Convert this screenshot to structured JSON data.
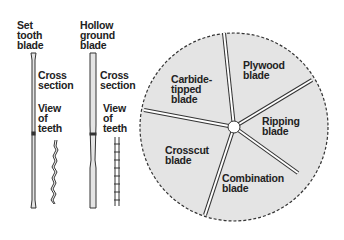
{
  "set_tooth": {
    "title": "Set\ntooth\nblade",
    "cross": "Cross\nsection",
    "view": "View\nof\nteeth"
  },
  "hollow_ground": {
    "title": "Hollow\nground\nblade",
    "cross": "Cross\nsection",
    "view": "View\nof\nteeth"
  },
  "circular_blade": {
    "segments": [
      {
        "label": "Carbide-\ntipped\nblade"
      },
      {
        "label": "Plywood\nblade"
      },
      {
        "label": "Ripping\nblade"
      },
      {
        "label": "Combination\nblade"
      },
      {
        "label": "Crosscut\nblade"
      }
    ],
    "colors": {
      "fill": "#e4e4e4",
      "stroke": "#333333"
    }
  }
}
